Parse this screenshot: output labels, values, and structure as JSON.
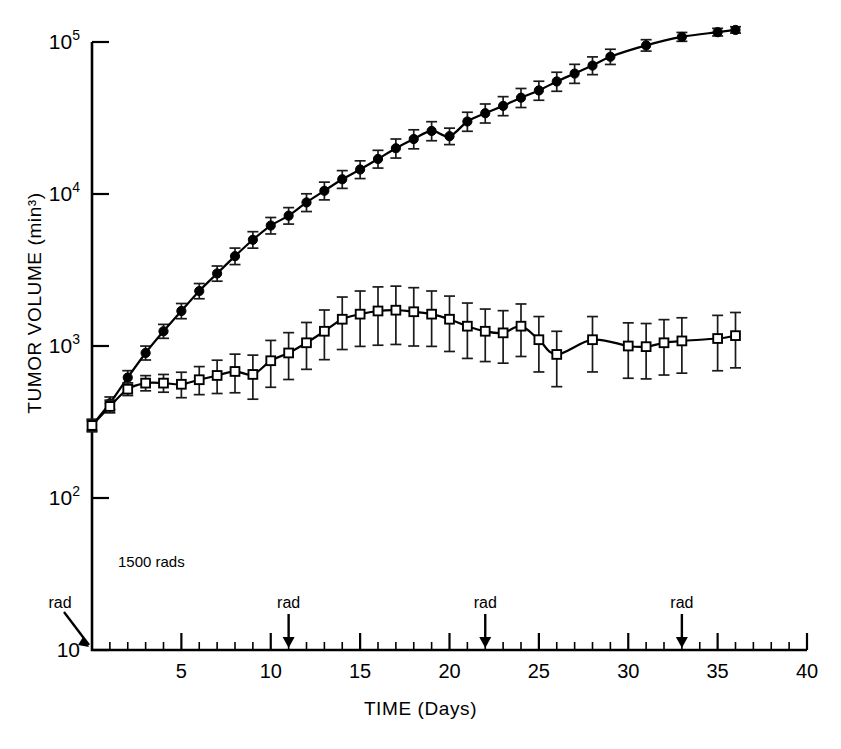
{
  "figure": {
    "title": "",
    "annotation_dose": "1500 rads",
    "rad_marker_label": "rad"
  },
  "axes": {
    "ylabel": "TUMOR VOLUME (min³)",
    "xlabel": "TIME (Days)",
    "y_tick_labels": [
      "10",
      "10²",
      "10³",
      "10⁴",
      "10⁵"
    ],
    "y_tick_values": [
      10,
      100,
      1000,
      10000,
      100000
    ],
    "x_tick_labels": [
      "5",
      "10",
      "15",
      "20",
      "25",
      "30",
      "35",
      "40"
    ],
    "x_tick_values": [
      5,
      10,
      15,
      20,
      25,
      30,
      35,
      40
    ]
  },
  "chart_data": {
    "type": "line",
    "title": "",
    "xlabel": "TIME (Days)",
    "ylabel": "TUMOR VOLUME (min³)",
    "yscale": "log",
    "xlim": [
      0,
      40
    ],
    "ylim": [
      10,
      100000
    ],
    "grid": false,
    "legend": "none",
    "annotations": [
      {
        "text": "1500 rads",
        "x": 2.2,
        "y": 45
      },
      {
        "text": "rad",
        "x": 0,
        "y": 10,
        "marker": "arrow-down"
      },
      {
        "text": "rad",
        "x": 11,
        "y": 10,
        "marker": "arrow-down"
      },
      {
        "text": "rad",
        "x": 22,
        "y": 10,
        "marker": "arrow-down"
      },
      {
        "text": "rad",
        "x": 33,
        "y": 10,
        "marker": "arrow-down"
      }
    ],
    "irradiation_days": [
      0,
      11,
      22,
      33
    ],
    "series": [
      {
        "name": "Untreated control",
        "marker": "filled-circle",
        "x": [
          0,
          1,
          2,
          3,
          4,
          5,
          6,
          7,
          8,
          9,
          10,
          11,
          12,
          13,
          14,
          15,
          16,
          17,
          18,
          19,
          20,
          21,
          22,
          23,
          24,
          25,
          26,
          27,
          28,
          29,
          31,
          33,
          35,
          36
        ],
        "y": [
          300,
          420,
          620,
          900,
          1250,
          1700,
          2300,
          3000,
          3900,
          5000,
          6200,
          7200,
          8800,
          10500,
          12500,
          14500,
          17000,
          20000,
          23000,
          26000,
          24000,
          30000,
          34000,
          38000,
          43000,
          48000,
          55000,
          62000,
          70000,
          80000,
          95000,
          108000,
          116000,
          120000
        ],
        "yerr_rel": [
          0.1,
          0.1,
          0.11,
          0.11,
          0.11,
          0.12,
          0.12,
          0.12,
          0.13,
          0.13,
          0.13,
          0.13,
          0.14,
          0.14,
          0.14,
          0.14,
          0.14,
          0.15,
          0.15,
          0.15,
          0.13,
          0.15,
          0.15,
          0.15,
          0.15,
          0.15,
          0.15,
          0.15,
          0.14,
          0.12,
          0.09,
          0.07,
          0.06,
          0.05
        ]
      },
      {
        "name": "1500 rads irradiated",
        "marker": "open-square",
        "x": [
          0,
          1,
          2,
          3,
          4,
          5,
          6,
          7,
          8,
          9,
          10,
          11,
          12,
          13,
          14,
          15,
          16,
          17,
          18,
          19,
          20,
          21,
          22,
          23,
          24,
          25,
          26,
          28,
          30,
          31,
          32,
          33,
          35,
          36
        ],
        "y": [
          300,
          400,
          520,
          570,
          570,
          560,
          600,
          640,
          680,
          650,
          800,
          900,
          1050,
          1250,
          1500,
          1620,
          1700,
          1720,
          1680,
          1620,
          1500,
          1350,
          1250,
          1220,
          1350,
          1100,
          880,
          1100,
          1000,
          990,
          1050,
          1080,
          1120,
          1170
        ],
        "yerr_rel": [
          0.08,
          0.1,
          0.1,
          0.12,
          0.14,
          0.2,
          0.22,
          0.26,
          0.3,
          0.34,
          0.36,
          0.36,
          0.36,
          0.38,
          0.4,
          0.42,
          0.44,
          0.44,
          0.44,
          0.42,
          0.42,
          0.42,
          0.4,
          0.4,
          0.4,
          0.42,
          0.42,
          0.42,
          0.42,
          0.42,
          0.42,
          0.42,
          0.42,
          0.42
        ]
      }
    ]
  }
}
